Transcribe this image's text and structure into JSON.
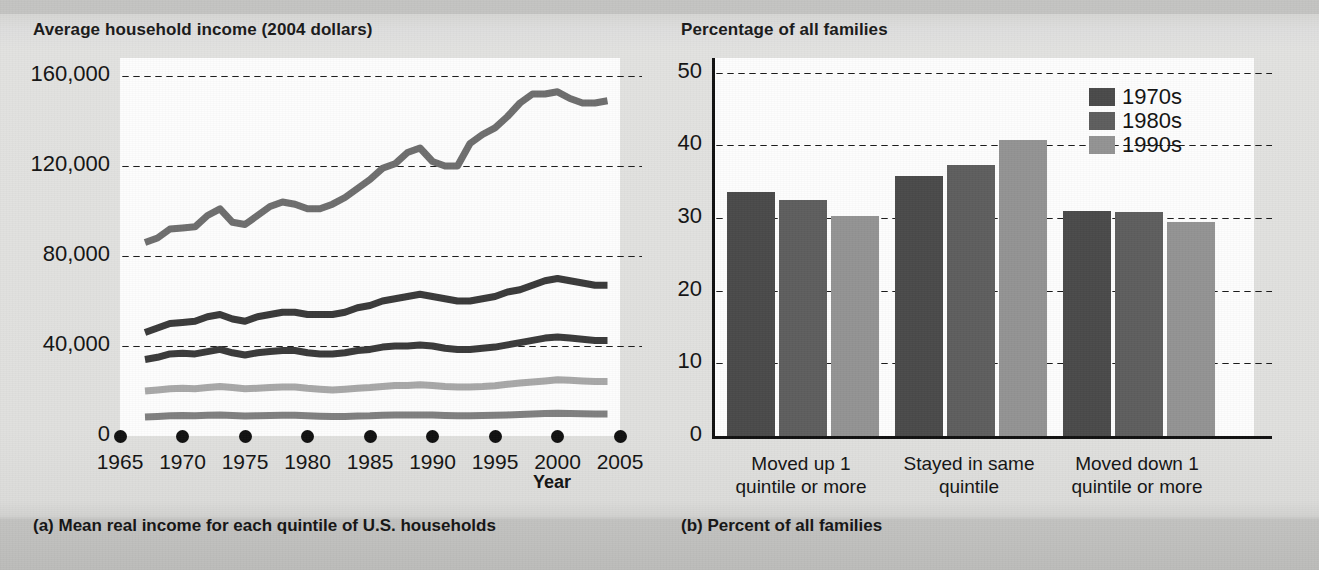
{
  "figure": {
    "background_color": "#dedede",
    "panel_a": {
      "axis_title": "Average household income (2004 dollars)",
      "caption": "(a) Mean real income for each quintile of U.S. households",
      "x_axis_name": "Year"
    },
    "panel_b": {
      "axis_title": "Percentage of all families",
      "caption": "(b) Percent of all families"
    }
  },
  "chart_data": [
    {
      "type": "line",
      "id": "panel-a",
      "title": "Average household income (2004 dollars)",
      "subtitle": "(a) Mean real income for each quintile of U.S. households",
      "xlabel": "Year",
      "ylabel": "Average household income (2004 dollars)",
      "xlim": [
        1965,
        2005
      ],
      "ylim": [
        0,
        168000
      ],
      "xticks": [
        1965,
        1970,
        1975,
        1980,
        1985,
        1990,
        1995,
        2000,
        2005
      ],
      "xtick_labels": [
        "1965",
        "1970",
        "1975",
        "1980",
        "1985",
        "1990",
        "1995",
        "2000",
        "2005"
      ],
      "yticks": [
        0,
        40000,
        80000,
        120000,
        160000
      ],
      "ytick_labels": [
        "0",
        "40,000",
        "80,000",
        "120,000",
        "160,000"
      ],
      "grid": "horizontal-dotted",
      "legend": "none",
      "x": [
        1967,
        1968,
        1969,
        1970,
        1971,
        1972,
        1973,
        1974,
        1975,
        1976,
        1977,
        1978,
        1979,
        1980,
        1981,
        1982,
        1983,
        1984,
        1985,
        1986,
        1987,
        1988,
        1989,
        1990,
        1991,
        1992,
        1993,
        1994,
        1995,
        1996,
        1997,
        1998,
        1999,
        2000,
        2001,
        2002,
        2003,
        2004
      ],
      "series": [
        {
          "name": "Top quintile",
          "color": "#6e6e6e",
          "values": [
            86000,
            88000,
            92000,
            92500,
            93000,
            98000,
            101000,
            95000,
            94000,
            98000,
            102000,
            104000,
            103000,
            101000,
            101000,
            103000,
            106000,
            110000,
            114000,
            119000,
            121000,
            126000,
            128000,
            122000,
            120000,
            120000,
            130000,
            134000,
            137000,
            142000,
            148000,
            152000,
            152000,
            153000,
            150000,
            148000,
            148000,
            149000
          ]
        },
        {
          "name": "Fourth quintile",
          "color": "#3a3a3a",
          "values": [
            46000,
            48000,
            50000,
            50500,
            51000,
            53000,
            54000,
            52000,
            51000,
            53000,
            54000,
            55000,
            55000,
            54000,
            54000,
            54000,
            55000,
            57000,
            58000,
            60000,
            61000,
            62000,
            63000,
            62000,
            61000,
            60000,
            60000,
            61000,
            62000,
            64000,
            65000,
            67000,
            69000,
            70000,
            69000,
            68000,
            67000,
            67000
          ]
        },
        {
          "name": "Middle quintile",
          "color": "#3a3a3a",
          "values": [
            34000,
            35000,
            36500,
            36800,
            36500,
            37500,
            38500,
            37000,
            36000,
            37000,
            37500,
            38000,
            38000,
            37000,
            36500,
            36500,
            37000,
            38000,
            38500,
            39500,
            40000,
            40000,
            40500,
            40000,
            39000,
            38500,
            38500,
            39000,
            39500,
            40500,
            41500,
            42500,
            43500,
            44000,
            43500,
            43000,
            42500,
            42500
          ]
        },
        {
          "name": "Second quintile",
          "color": "#a8a8a8",
          "values": [
            20000,
            20500,
            21000,
            21200,
            21000,
            21500,
            22000,
            21500,
            21000,
            21200,
            21500,
            21800,
            21800,
            21200,
            20800,
            20500,
            20800,
            21200,
            21500,
            22000,
            22500,
            22500,
            22800,
            22500,
            22000,
            21800,
            21800,
            22000,
            22300,
            23000,
            23500,
            24000,
            24500,
            25000,
            24800,
            24500,
            24200,
            24200
          ]
        },
        {
          "name": "Bottom quintile",
          "color": "#808080",
          "values": [
            8500,
            8700,
            9000,
            9100,
            9000,
            9200,
            9300,
            9100,
            8900,
            9000,
            9100,
            9200,
            9200,
            9000,
            8800,
            8600,
            8700,
            8900,
            9000,
            9200,
            9300,
            9300,
            9400,
            9300,
            9100,
            9000,
            9000,
            9100,
            9200,
            9400,
            9600,
            9800,
            10000,
            10100,
            10000,
            9900,
            9800,
            9800
          ]
        }
      ]
    },
    {
      "type": "bar",
      "id": "panel-b",
      "title": "Percentage of all families",
      "subtitle": "(b) Percent of all families",
      "xlabel": "",
      "ylabel": "Percentage of all families",
      "ylim": [
        0,
        52
      ],
      "yticks": [
        0,
        10,
        20,
        30,
        40,
        50
      ],
      "ytick_labels": [
        "0",
        "10",
        "20",
        "30",
        "40",
        "50"
      ],
      "grid": "horizontal-dotted",
      "legend_position": "top-right",
      "categories": [
        "Moved up 1 quintile or more",
        "Stayed in same quintile",
        "Moved down 1 quintile or more"
      ],
      "category_lines": [
        [
          "Moved up 1",
          "quintile or more"
        ],
        [
          "Stayed in same",
          "quintile"
        ],
        [
          "Moved down 1",
          "quintile or more"
        ]
      ],
      "series": [
        {
          "name": "1970s",
          "color": "#4a4a4a",
          "values": [
            33.5,
            35.8,
            31.0
          ]
        },
        {
          "name": "1980s",
          "color": "#5e5e5e",
          "values": [
            32.5,
            37.3,
            30.8
          ]
        },
        {
          "name": "1990s",
          "color": "#939393",
          "values": [
            30.2,
            40.7,
            29.5
          ]
        }
      ]
    }
  ],
  "legend": {
    "items": [
      {
        "label": "1970s",
        "color": "#4a4a4a"
      },
      {
        "label": "1980s",
        "color": "#5e5e5e"
      },
      {
        "label": "1990s",
        "color": "#939393"
      }
    ]
  }
}
